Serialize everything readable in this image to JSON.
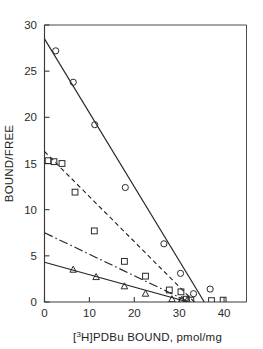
{
  "figure": {
    "background_color": "#ffffff",
    "line_color": "#252525",
    "marker_color": "#2a2a2a",
    "axis_color": "#3a3a3a"
  },
  "axes": {
    "y_axis_title": "BOUND/FREE",
    "y_ticks": [
      "0",
      "5",
      "10",
      "15",
      "20",
      "25",
      "30"
    ],
    "x_ticks": [
      "0",
      "10",
      "20",
      "30",
      "40"
    ],
    "x_axis_title_parts": {
      "pre": "[",
      "sup": "3",
      "post": "H]PDBu BOUND, pmol/mg"
    },
    "x_axis_title": "[3H]PDBu BOUND, pmol/mg"
  },
  "chart_data": {
    "type": "scatter",
    "title": "",
    "xlabel": "[3H]PDBu BOUND, pmol/mg",
    "ylabel": "BOUND/FREE",
    "xlim": [
      0,
      45
    ],
    "ylim": [
      0,
      30
    ],
    "xticks": [
      0,
      10,
      20,
      30,
      40
    ],
    "yticks": [
      0,
      5,
      10,
      15,
      20,
      25,
      30
    ],
    "grid": false,
    "legend": "none",
    "series": [
      {
        "name": "Series A (circles)",
        "marker": "circle",
        "linestyle": "solid",
        "fit_line": {
          "x": [
            0,
            35.6
          ],
          "y": [
            28.5,
            0
          ]
        },
        "points": [
          {
            "x": 2.5,
            "y": 27.2
          },
          {
            "x": 6.4,
            "y": 23.8
          },
          {
            "x": 11.2,
            "y": 19.2
          },
          {
            "x": 18.0,
            "y": 12.4
          },
          {
            "x": 26.6,
            "y": 6.3
          },
          {
            "x": 30.3,
            "y": 3.1
          },
          {
            "x": 33.2,
            "y": 0.9
          },
          {
            "x": 36.9,
            "y": 1.4
          }
        ]
      },
      {
        "name": "Series B (squares)",
        "marker": "square",
        "linestyle": "dashed",
        "fit_line": {
          "x": [
            0,
            33.4
          ],
          "y": [
            16.3,
            0
          ]
        },
        "points": [
          {
            "x": 0.8,
            "y": 15.3
          },
          {
            "x": 2.1,
            "y": 15.2
          },
          {
            "x": 3.9,
            "y": 15.0
          },
          {
            "x": 6.8,
            "y": 11.9
          },
          {
            "x": 11.1,
            "y": 7.7
          },
          {
            "x": 17.8,
            "y": 4.4
          },
          {
            "x": 22.5,
            "y": 2.8
          },
          {
            "x": 27.8,
            "y": 1.3
          },
          {
            "x": 30.4,
            "y": 1.1
          },
          {
            "x": 31.6,
            "y": 0.3
          },
          {
            "x": 32.6,
            "y": 0.2
          },
          {
            "x": 37.2,
            "y": 0.15
          },
          {
            "x": 39.8,
            "y": 0.2
          }
        ]
      },
      {
        "name": "Series C (dash-dot)",
        "marker": "none",
        "linestyle": "dashdot",
        "fit_line": {
          "x": [
            0,
            32.2
          ],
          "y": [
            7.5,
            0
          ]
        },
        "points": []
      },
      {
        "name": "Series D (triangles)",
        "marker": "triangle",
        "linestyle": "solid",
        "fit_line": {
          "x": [
            0,
            32.0
          ],
          "y": [
            4.3,
            0
          ]
        },
        "points": [
          {
            "x": 6.4,
            "y": 3.5
          },
          {
            "x": 11.5,
            "y": 2.7
          },
          {
            "x": 17.8,
            "y": 1.7
          },
          {
            "x": 22.5,
            "y": 0.9
          },
          {
            "x": 28.4,
            "y": 0.3
          },
          {
            "x": 30.6,
            "y": 0.25
          },
          {
            "x": 31.8,
            "y": 0.2
          }
        ]
      }
    ]
  }
}
